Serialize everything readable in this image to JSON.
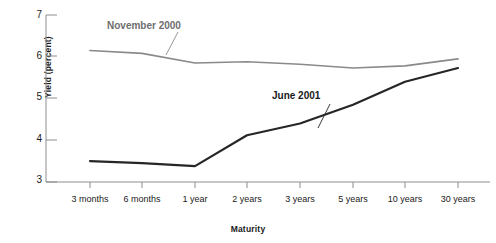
{
  "chart_data": {
    "type": "line",
    "title": "",
    "xlabel": "Maturity",
    "ylabel": "Yield (percent)",
    "categories": [
      "3 months",
      "6 months",
      "1 year",
      "2 years",
      "3 years",
      "5 years",
      "10 years",
      "30 years"
    ],
    "ylim": [
      3,
      7
    ],
    "yticks": [
      3,
      4,
      5,
      6,
      7
    ],
    "grid": false,
    "legend_position": "inline-annotations",
    "series": [
      {
        "name": "November 2000",
        "color": "#8a8a8a",
        "values": [
          6.15,
          6.08,
          5.85,
          5.88,
          5.82,
          5.73,
          5.78,
          5.95
        ]
      },
      {
        "name": "June 2001",
        "color": "#262626",
        "values": [
          3.5,
          3.45,
          3.38,
          4.12,
          4.4,
          4.85,
          5.4,
          5.73
        ]
      }
    ],
    "annotations": [
      {
        "text": "November 2000",
        "series": "November 2000"
      },
      {
        "text": "June 2001",
        "series": "June 2001"
      }
    ]
  }
}
